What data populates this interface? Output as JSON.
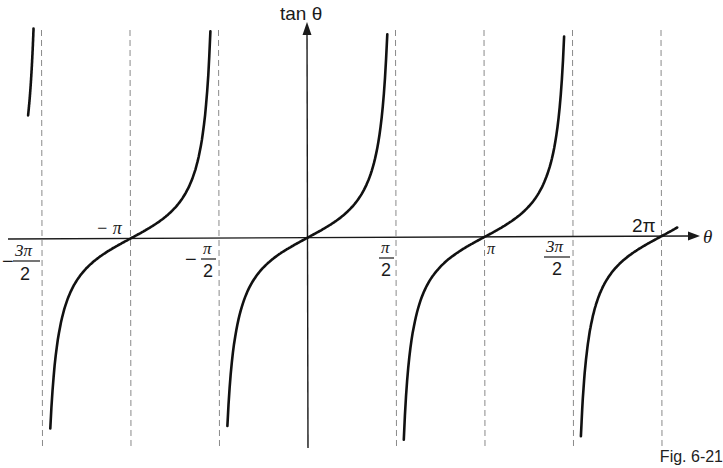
{
  "chart_data": {
    "type": "line",
    "title": "",
    "function": "tan θ",
    "xlabel": "θ",
    "ylabel": "tan θ",
    "xlim": [
      -4.95,
      6.7
    ],
    "ylim": [
      -7.5,
      7.5
    ],
    "grid": false,
    "legend": null,
    "x_tick_labels": [
      {
        "value": -4.7124,
        "label": "−3π/2",
        "num": "3π",
        "den": "2",
        "sign": "−"
      },
      {
        "value": -3.1416,
        "label": "−π"
      },
      {
        "value": -1.5708,
        "label": "−π/2",
        "num": "π",
        "den": "2",
        "sign": "−"
      },
      {
        "value": 1.5708,
        "label": "π/2",
        "num": "π",
        "den": "2",
        "sign": ""
      },
      {
        "value": 3.1416,
        "label": "π"
      },
      {
        "value": 4.7124,
        "label": "3π/2",
        "num": "3π",
        "den": "2",
        "sign": ""
      },
      {
        "value": 6.2832,
        "label": "2π"
      }
    ],
    "asymptotes": [
      -4.7124,
      -1.5708,
      1.5708,
      4.7124
    ],
    "dashed_guides": [
      -4.7124,
      -3.1416,
      -1.5708,
      1.5708,
      3.1416,
      4.7124,
      6.2832
    ],
    "zeros": [
      -3.1416,
      0,
      3.1416,
      6.2832
    ],
    "branches": [
      {
        "x_from": -4.95,
        "x_to": -4.76
      },
      {
        "x_from": -4.65,
        "x_to": -1.62
      },
      {
        "x_from": -1.51,
        "x_to": 1.62
      },
      {
        "x_from": 1.62,
        "x_to": 4.76
      },
      {
        "x_from": 4.76,
        "x_to": 6.57
      }
    ],
    "series": [
      {
        "name": "tan θ",
        "x": [
          -3.1416,
          -2.356,
          -1.5708,
          0,
          0.7854,
          3.1416,
          3.927,
          6.2832
        ],
        "values": [
          0,
          1,
          null,
          0,
          1,
          0,
          1,
          0
        ]
      }
    ],
    "annotations": [
      "Fig. 6-21"
    ]
  },
  "labels": {
    "y_axis": "tan θ",
    "x_axis": "θ",
    "neg_pi": "− π",
    "pi": "π",
    "two_pi": "2π",
    "caption": "Fig. 6-21"
  }
}
